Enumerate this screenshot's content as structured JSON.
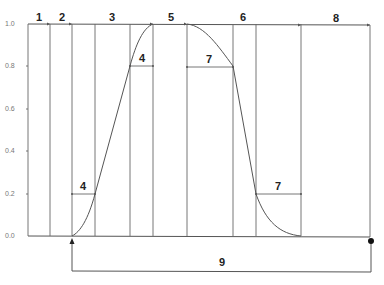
{
  "diagram": {
    "type": "waveform-timing",
    "y_axis": {
      "ticks": [
        "1.0",
        "0.8",
        "0.6",
        "0.4",
        "0.2",
        "0.0"
      ]
    },
    "top_segments": [
      {
        "label": "1"
      },
      {
        "label": "2"
      },
      {
        "label": "3"
      },
      {
        "label": "5"
      },
      {
        "label": "6"
      },
      {
        "label": "8"
      }
    ],
    "interval_labels": {
      "rise_low": "4",
      "rise_high": "4",
      "fall_high": "7",
      "fall_low": "7"
    },
    "period_label": "9",
    "colors": {
      "line": "#555555",
      "text": "#222222",
      "tick_text": "#777777"
    }
  }
}
